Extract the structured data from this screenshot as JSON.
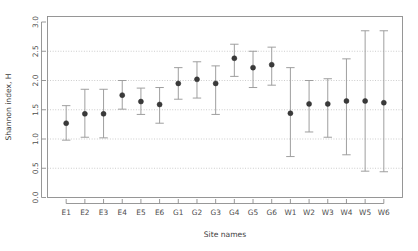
{
  "chart_data": {
    "type": "scatter",
    "title": "",
    "xlabel": "Site names",
    "ylabel": "Shannon index, H",
    "categories": [
      "E1",
      "E2",
      "E3",
      "E4",
      "E5",
      "E6",
      "G1",
      "G2",
      "G3",
      "G4",
      "G5",
      "G6",
      "W1",
      "W2",
      "W3",
      "W4",
      "W5",
      "W6"
    ],
    "values": [
      1.27,
      1.43,
      1.43,
      1.75,
      1.64,
      1.59,
      1.95,
      2.02,
      1.95,
      2.38,
      2.22,
      2.27,
      1.44,
      1.6,
      1.6,
      1.65,
      1.65,
      1.62
    ],
    "lower": [
      0.98,
      1.03,
      1.02,
      1.51,
      1.42,
      1.27,
      1.68,
      1.7,
      1.42,
      2.07,
      1.88,
      1.92,
      0.7,
      1.12,
      1.03,
      0.73,
      0.45,
      0.44
    ],
    "upper": [
      1.57,
      1.85,
      1.85,
      2.0,
      1.87,
      1.88,
      2.22,
      2.32,
      2.25,
      2.62,
      2.5,
      2.57,
      2.22,
      2.0,
      2.03,
      2.37,
      2.85,
      2.85
    ],
    "ylim": [
      0.0,
      3.1
    ],
    "yticks": [
      "0.0",
      "0.5",
      "1.0",
      "1.5",
      "2.0",
      "2.5",
      "3.0"
    ],
    "ytick_values": [
      0.0,
      0.5,
      1.0,
      1.5,
      2.0,
      2.5,
      3.0
    ],
    "gridlines_at": [
      0.5,
      1.0,
      1.5,
      2.0,
      2.5
    ],
    "grid": true,
    "legend": "none",
    "error_bar_type": "confidence-interval",
    "point_color": "#3a3a3a",
    "errorbar_color": "#9a9a9a",
    "grid_color": "#b9b9b9",
    "frame_color": "#8c8c8c"
  }
}
